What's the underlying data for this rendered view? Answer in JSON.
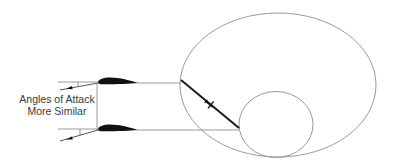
{
  "caption": {
    "line1": "Angles of Attack",
    "line2": "More Similar"
  },
  "colors": {
    "stroke": "#9a9a9a",
    "blade": "#1a1a1a",
    "airfoil": "#111111",
    "text": "#3a3a3a",
    "background": "#ffffff"
  },
  "shapes": {
    "outer_ellipse": {
      "cx": 278,
      "cy": 85,
      "rx": 98,
      "ry": 72
    },
    "inner_circle": {
      "cx": 276,
      "cy": 124.5,
      "rx": 37,
      "ry": 33
    },
    "blade": {
      "x1": 181,
      "y1": 80,
      "x2": 239,
      "y2": 128
    },
    "upper_radius_line_y": 83,
    "lower_radius_line_y": 130
  }
}
